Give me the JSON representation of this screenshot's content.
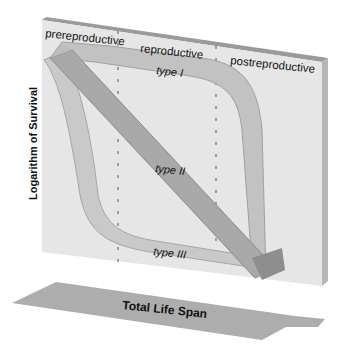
{
  "diagram": {
    "y_axis_label": "Logarithm of Survival",
    "x_axis_label": "Total Life Span",
    "phases": [
      "prereproductive",
      "reproductive",
      "postreproductive"
    ],
    "curves": [
      {
        "name": "type I",
        "shape": "high survival until late life, then steep drop"
      },
      {
        "name": "type II",
        "shape": "constant diagonal decline"
      },
      {
        "name": "type III",
        "shape": "steep early drop, then low and flat"
      }
    ],
    "colors": {
      "panel_face": "#e4e4e4",
      "panel_top": "#9a9a9a",
      "panel_side": "#b4b4b4",
      "ribbon": "#b8b8b8",
      "ribbon_dark": "#8e8e8e",
      "floor": "#a8a8a8",
      "text": "#111111"
    }
  }
}
